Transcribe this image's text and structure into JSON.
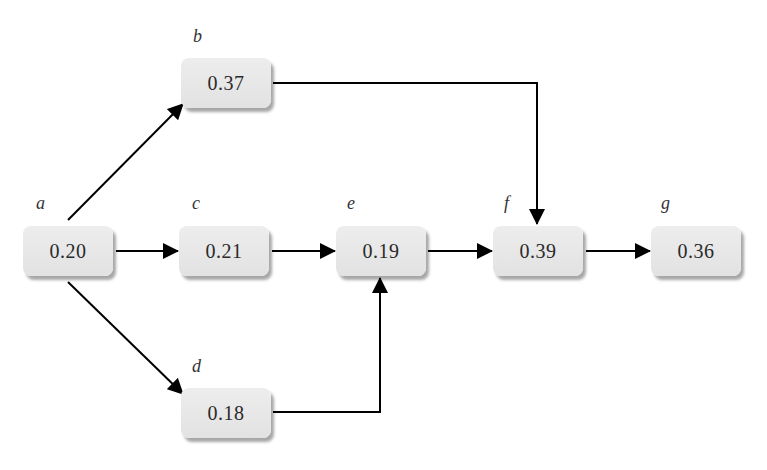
{
  "diagram": {
    "type": "directed-graph",
    "nodes": [
      {
        "id": "a",
        "label": "a",
        "value": "0.20",
        "x": 23,
        "y": 226
      },
      {
        "id": "b",
        "label": "b",
        "value": "0.37",
        "x": 181,
        "y": 58
      },
      {
        "id": "c",
        "label": "c",
        "value": "0.21",
        "x": 179,
        "y": 226
      },
      {
        "id": "d",
        "label": "d",
        "value": "0.18",
        "x": 181,
        "y": 388
      },
      {
        "id": "e",
        "label": "e",
        "value": "0.19",
        "x": 336,
        "y": 226
      },
      {
        "id": "f",
        "label": "f",
        "value": "0.39",
        "x": 493,
        "y": 226
      },
      {
        "id": "g",
        "label": "g",
        "value": "0.36",
        "x": 651,
        "y": 226
      }
    ],
    "edges": [
      {
        "from": "a",
        "to": "b"
      },
      {
        "from": "a",
        "to": "c"
      },
      {
        "from": "a",
        "to": "d"
      },
      {
        "from": "b",
        "to": "f"
      },
      {
        "from": "c",
        "to": "e"
      },
      {
        "from": "d",
        "to": "e"
      },
      {
        "from": "e",
        "to": "f"
      },
      {
        "from": "f",
        "to": "g"
      }
    ],
    "colors": {
      "node_fill": "#e6e6e6",
      "edge": "#000000",
      "text": "#2a2a2a"
    }
  }
}
